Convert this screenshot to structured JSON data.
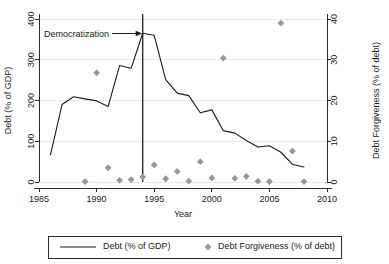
{
  "chart_data": {
    "type": "line",
    "title": "",
    "xlabel": "Year",
    "ylabel": "Debt  (% of GDP)",
    "y2label": "Debt Forgiveness (% of debt)",
    "xlim": [
      1985,
      2010
    ],
    "ylim": [
      0,
      400
    ],
    "y2lim": [
      0,
      40
    ],
    "xticks": [
      "1985",
      "1990",
      "1995",
      "2000",
      "2005",
      "2010"
    ],
    "xtick_values": [
      1985,
      1990,
      1995,
      2000,
      2005,
      2010
    ],
    "yticks": [
      "0",
      "100",
      "200",
      "300",
      "400"
    ],
    "ytick_values": [
      0,
      100,
      200,
      300,
      400
    ],
    "y2ticks": [
      "0",
      "10",
      "20",
      "30",
      "40"
    ],
    "y2tick_values": [
      0,
      10,
      20,
      30,
      40
    ],
    "grid": "horizontal",
    "legend_position": "below",
    "series": [
      {
        "name": "Debt  (% of GDP)",
        "type": "line",
        "axis": "left",
        "color": "#1a1a1a",
        "x": [
          1986,
          1987,
          1988,
          1989,
          1990,
          1991,
          1992,
          1993,
          1994,
          1995,
          1996,
          1997,
          1998,
          1999,
          2000,
          2001,
          2002,
          2003,
          2004,
          2005,
          2006,
          2007,
          2008
        ],
        "values": [
          67,
          190,
          209,
          204,
          199,
          185,
          286,
          279,
          365,
          360,
          251,
          218,
          212,
          170,
          177,
          126,
          120,
          102,
          86,
          89,
          73,
          43,
          37
        ]
      },
      {
        "name": "Debt Forgiveness (% of debt)",
        "type": "scatter",
        "axis": "right",
        "color": "#979797",
        "marker": "diamond",
        "x": [
          1989,
          1990,
          1991,
          1992,
          1993,
          1994,
          1995,
          1996,
          1997,
          1998,
          1999,
          2000,
          2001,
          2002,
          2003,
          2004,
          2005,
          2006,
          2007,
          2008
        ],
        "values": [
          0.1,
          26.8,
          3.5,
          0.4,
          0.6,
          1.2,
          4.2,
          0.8,
          2.6,
          0.2,
          5.0,
          1.0,
          30.4,
          0.9,
          1.4,
          0.2,
          0.1,
          39.0,
          7.6,
          0.1
        ]
      }
    ],
    "annotations": [
      {
        "text": "Democratization",
        "x": 1994,
        "note": "vertical reference line at year 1994 with arrow label"
      }
    ],
    "vertical_line": {
      "x": 1994
    }
  },
  "legend": {
    "entries": [
      {
        "label": "Debt  (% of GDP)",
        "marker": "line"
      },
      {
        "label": "Debt Forgiveness (% of debt)",
        "marker": "diamond"
      }
    ]
  },
  "colors": {
    "line": "#1a1a1a",
    "marker": "#979797",
    "grid": "#e9e9e9",
    "axis": "#2b2b2b",
    "background": "#ffffff"
  }
}
